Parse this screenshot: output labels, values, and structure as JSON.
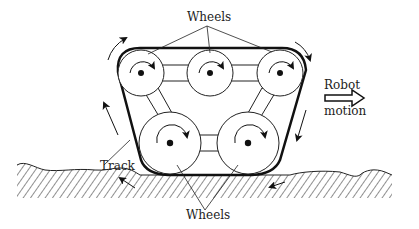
{
  "diagram": {
    "labels": {
      "wheels_top": "Wheels",
      "wheels_bottom": "Wheels",
      "track": "Track",
      "robot_line1": "Robot",
      "robot_line2": "motion"
    },
    "components": [
      "track",
      "top-left-wheel",
      "top-middle-wheel",
      "top-right-wheel",
      "bottom-left-wheel",
      "bottom-right-wheel",
      "ground",
      "robot-motion-arrow"
    ],
    "colors": {
      "stroke": "#111111",
      "background": "#ffffff"
    }
  }
}
